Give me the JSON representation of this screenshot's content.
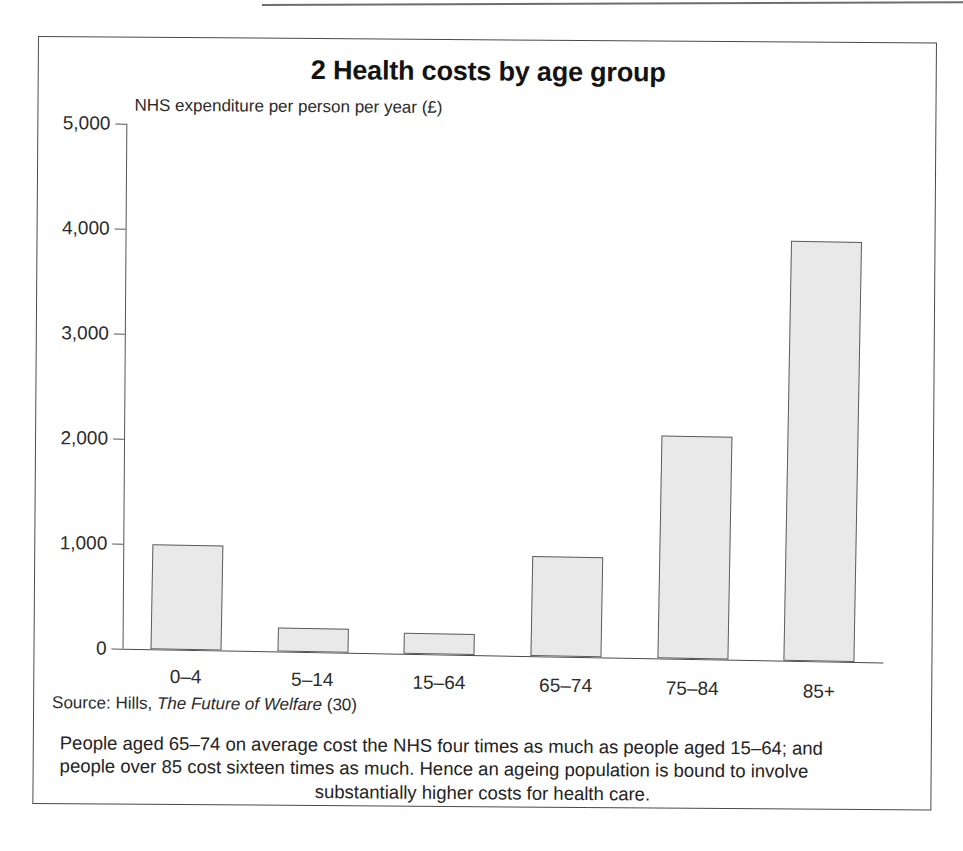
{
  "figure": {
    "title": "2 Health costs by age group",
    "axis_label": "NHS expenditure per person per year (£)",
    "source_prefix": "Source: Hills,",
    "source_title": "The Future of Welfare",
    "source_suffix": "(30)",
    "caption_line1": "People aged 65–74 on average cost the NHS four times as much as people aged 15–64; and",
    "caption_line2": "people over 85 cost sixteen times as much. Hence an ageing population is bound to involve",
    "caption_line3": "substantially higher costs for health care.",
    "bar_fill": "#e9e9e9",
    "bar_stroke": "#5c5c5c",
    "frame_color": "#4a4a4a"
  },
  "chart_data": {
    "type": "bar",
    "title": "2 Health costs by age group",
    "xlabel": "",
    "ylabel": "NHS expenditure per person per year (£)",
    "ylim": [
      0,
      5000
    ],
    "yticks": [
      0,
      1000,
      2000,
      3000,
      4000,
      5000
    ],
    "ytick_labels": [
      "0",
      "1,000",
      "2,000",
      "3,000",
      "4,000",
      "5,000"
    ],
    "grid": false,
    "legend": null,
    "categories": [
      "0–4",
      "5–14",
      "15–64",
      "65–74",
      "75–84",
      "85+"
    ],
    "values": [
      1000,
      230,
      200,
      950,
      2120,
      4000
    ],
    "units": "£ per person per year"
  }
}
